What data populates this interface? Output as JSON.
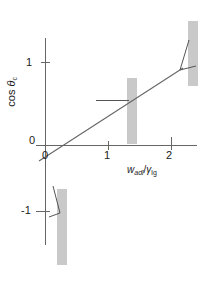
{
  "figure": {
    "background_color": "#ffffff",
    "axis_color": "#555555",
    "line_color": "#555555",
    "substrate_color": "#c9c9c9"
  },
  "axes": {
    "y_label_prefix": "cos ",
    "y_label_symbol": "θ",
    "y_label_subscript": "c",
    "x_label_symbol": "w",
    "x_label_subscript": "adl",
    "x_label_divider": "/",
    "x_label_symbol2": "γ",
    "x_label_subscript2": "lg",
    "x_ticks": [
      "0",
      "1",
      "2"
    ],
    "y_ticks": [
      "1",
      "0",
      "-1"
    ]
  },
  "chart_data": {
    "type": "line",
    "title": "",
    "xlabel": "w_adl / γ_lg",
    "ylabel": "cos θ_c",
    "xlim": [
      -0.25,
      2.25
    ],
    "ylim": [
      -1.6,
      1.45
    ],
    "grid": false,
    "legend": "none",
    "series": [
      {
        "name": "Young-Dupré relation",
        "x": [
          -0.25,
          0,
          1,
          2,
          2.1
        ],
        "y": [
          -1.25,
          -1,
          0,
          1,
          1.1
        ],
        "equation": "cos θ_c = w_adl/γ_lg - 1",
        "slope": 1,
        "intercept": -1
      }
    ],
    "annotations": [
      {
        "name": "non-wetting-droplet",
        "x": 0,
        "y": -1,
        "description": "narrow droplet on vertical substrate, large contact angle (θ ≈ 180°)"
      },
      {
        "name": "partial-wetting-droplet",
        "x": 1,
        "y": 0,
        "description": "flat droplet on vertical substrate, contact angle θ = 90°"
      },
      {
        "name": "wetting-droplet",
        "x": 2,
        "y": 1,
        "description": "spread droplet on vertical substrate, small contact angle (θ ≈ 0°)"
      }
    ]
  }
}
